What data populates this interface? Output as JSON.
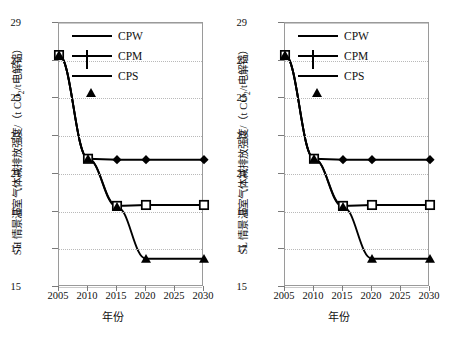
{
  "figure": {
    "panels": [
      {
        "id": "sh-panel",
        "ylabel_prefix": "SH 情景温室气体减排放强度/（t CO",
        "ylabel_sub": "2",
        "ylabel_suffix": "/t电解铝）",
        "xtitle": "年份"
      },
      {
        "id": "sl-panel",
        "ylabel_prefix": "SL 情景温室气体减排放强度/（t CO",
        "ylabel_sub": "2",
        "ylabel_suffix": "/t电解铝）",
        "xtitle": "年份"
      }
    ],
    "legend": [
      {
        "label": "CPW",
        "marker": "filled-diamond-icon"
      },
      {
        "label": "CPM",
        "marker": "open-square-icon"
      },
      {
        "label": "CPS",
        "marker": "filled-triangle-icon"
      }
    ],
    "yticks": [
      "29",
      "27",
      "25",
      "23",
      "21",
      "19",
      "17",
      "15"
    ],
    "xticks": [
      "2005",
      "2010",
      "2015",
      "2020",
      "2025",
      "2030"
    ],
    "colors": {
      "line": "#000000",
      "grid": "#c0c0c0",
      "axis": "#9a9a9a",
      "text": "#111111"
    }
  },
  "chart_data": [
    {
      "type": "line",
      "title": "",
      "panel": "SH",
      "xlabel": "年份",
      "ylabel": "SH 情景温室气体减排放强度/（t CO2/t电解铝）",
      "x": [
        2005,
        2010,
        2015,
        2020,
        2030
      ],
      "xlim": [
        2005,
        2030
      ],
      "ylim": [
        15,
        29
      ],
      "ytick_values": [
        15,
        17,
        19,
        21,
        23,
        25,
        27,
        29
      ],
      "xtick_values": [
        2005,
        2010,
        2015,
        2020,
        2025,
        2030
      ],
      "grid": true,
      "legend_position": "top-left-inside",
      "series": [
        {
          "name": "CPW",
          "marker": "filled-diamond",
          "values": [
            27.3,
            21.8,
            21.75,
            21.75,
            21.75
          ]
        },
        {
          "name": "CPM",
          "marker": "open-square",
          "values": [
            27.3,
            21.8,
            19.3,
            19.35,
            19.35
          ]
        },
        {
          "name": "CPS",
          "marker": "filled-triangle",
          "values": [
            27.3,
            21.8,
            19.25,
            16.5,
            16.5
          ]
        }
      ]
    },
    {
      "type": "line",
      "title": "",
      "panel": "SL",
      "xlabel": "年份",
      "ylabel": "SL 情景温室气体减排放强度/（t CO2/t电解铝）",
      "x": [
        2005,
        2010,
        2015,
        2020,
        2030
      ],
      "xlim": [
        2005,
        2030
      ],
      "ylim": [
        15,
        29
      ],
      "ytick_values": [
        15,
        17,
        19,
        21,
        23,
        25,
        27,
        29
      ],
      "xtick_values": [
        2005,
        2010,
        2015,
        2020,
        2025,
        2030
      ],
      "grid": true,
      "legend_position": "top-left-inside",
      "series": [
        {
          "name": "CPW",
          "marker": "filled-diamond",
          "values": [
            27.3,
            21.8,
            21.75,
            21.75,
            21.75
          ]
        },
        {
          "name": "CPM",
          "marker": "open-square",
          "values": [
            27.3,
            21.8,
            19.3,
            19.35,
            19.35
          ]
        },
        {
          "name": "CPS",
          "marker": "filled-triangle",
          "values": [
            27.3,
            21.8,
            19.25,
            16.5,
            16.5
          ]
        }
      ]
    }
  ]
}
